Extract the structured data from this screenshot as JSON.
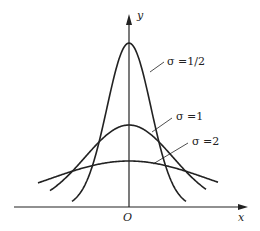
{
  "figure": {
    "axis_labels": {
      "x": "x",
      "y": "y",
      "origin": "O"
    },
    "curves": [
      {
        "label": "σ =1/2",
        "sigma": 0.5
      },
      {
        "label": "σ =1",
        "sigma": 1
      },
      {
        "label": "σ =2",
        "sigma": 2
      }
    ]
  },
  "colors": {
    "line": "#222222",
    "background": "#ffffff"
  }
}
